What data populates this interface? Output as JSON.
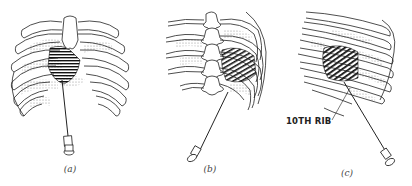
{
  "figure": {
    "panels": [
      {
        "id": "a",
        "caption": "(a)",
        "view": "anterior rib cage with needle inserted below costal margin"
      },
      {
        "id": "b",
        "caption": "(b)",
        "view": "posterior rib cage with vertebral column and needle"
      },
      {
        "id": "c",
        "caption": "(c)",
        "view": "lateral rib cage with needle",
        "annotation": "10TH RIB"
      }
    ]
  }
}
